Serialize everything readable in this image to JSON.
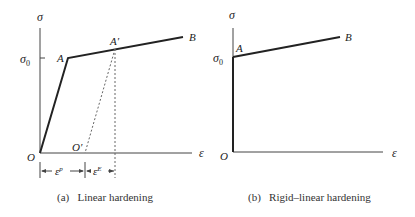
{
  "panels": [
    {
      "id": "a",
      "caption": "(a)   Linear hardening",
      "y_axis_label": "σ",
      "x_axis_label": "ε",
      "yield_label": "σ",
      "yield_subscript": "0",
      "origin_label": "O",
      "points": {
        "A": "A",
        "A_prime": "A′",
        "B": "B",
        "O_prime": "O′"
      },
      "dimension_labels": {
        "plastic": "ε",
        "plastic_sup": "p",
        "elastic": "ε",
        "elastic_sup": "E"
      }
    },
    {
      "id": "b",
      "caption": "(b)   Rigid–linear hardening",
      "y_axis_label": "σ",
      "x_axis_label": "ε",
      "yield_label": "σ",
      "yield_subscript": "0",
      "origin_label": "O",
      "points": {
        "A": "A",
        "B": "B"
      }
    }
  ],
  "colors": {
    "line": "#222222",
    "dashed": "#555555",
    "text": "#222222"
  }
}
